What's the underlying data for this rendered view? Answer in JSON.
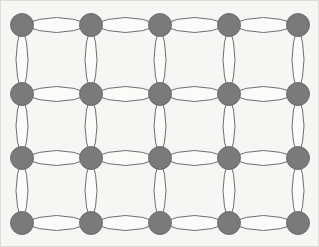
{
  "figure": {
    "type": "graph-diagram",
    "width": 319,
    "height": 247,
    "background_color": "#f6f6f4",
    "border_color": "#dcdcd8"
  },
  "style": {
    "node_fill": "#7a7a7a",
    "node_stroke": "#5f5f5f",
    "node_stroke_width": 0.8,
    "node_radius": 11.5,
    "edge_stroke": "#6e6e6e",
    "edge_stroke_width": 1.0,
    "edge_fill": "#fbfbfa",
    "edge_bulge_horizontal": 7.5,
    "edge_bulge_vertical": 6.0
  },
  "graph": {
    "description": "4 rows by 5 columns lattice of vertices; every adjacent pair joined by a pair of parallel curved edges forming a lens shape",
    "rows": 4,
    "columns": 5,
    "node_count": 20,
    "edge_multiplicity": 2,
    "horizontal_edge_pairs": 15,
    "vertical_edge_pairs": 15,
    "total_edge_pairs": 30,
    "total_edges": 60,
    "column_x": [
      22,
      91,
      160,
      229,
      298
    ],
    "row_y": [
      25,
      94,
      158,
      223
    ],
    "nodes": [
      {
        "id": "n-0-0",
        "row": 0,
        "col": 0,
        "x": 22,
        "y": 25
      },
      {
        "id": "n-0-1",
        "row": 0,
        "col": 1,
        "x": 91,
        "y": 25
      },
      {
        "id": "n-0-2",
        "row": 0,
        "col": 2,
        "x": 160,
        "y": 25
      },
      {
        "id": "n-0-3",
        "row": 0,
        "col": 3,
        "x": 229,
        "y": 25
      },
      {
        "id": "n-0-4",
        "row": 0,
        "col": 4,
        "x": 298,
        "y": 25
      },
      {
        "id": "n-1-0",
        "row": 1,
        "col": 0,
        "x": 22,
        "y": 94
      },
      {
        "id": "n-1-1",
        "row": 1,
        "col": 1,
        "x": 91,
        "y": 94
      },
      {
        "id": "n-1-2",
        "row": 1,
        "col": 2,
        "x": 160,
        "y": 94
      },
      {
        "id": "n-1-3",
        "row": 1,
        "col": 3,
        "x": 229,
        "y": 94
      },
      {
        "id": "n-1-4",
        "row": 1,
        "col": 4,
        "x": 298,
        "y": 94
      },
      {
        "id": "n-2-0",
        "row": 2,
        "col": 0,
        "x": 22,
        "y": 158
      },
      {
        "id": "n-2-1",
        "row": 2,
        "col": 1,
        "x": 91,
        "y": 158
      },
      {
        "id": "n-2-2",
        "row": 2,
        "col": 2,
        "x": 160,
        "y": 158
      },
      {
        "id": "n-2-3",
        "row": 2,
        "col": 3,
        "x": 229,
        "y": 158
      },
      {
        "id": "n-2-4",
        "row": 2,
        "col": 4,
        "x": 298,
        "y": 158
      },
      {
        "id": "n-3-0",
        "row": 3,
        "col": 0,
        "x": 22,
        "y": 223
      },
      {
        "id": "n-3-1",
        "row": 3,
        "col": 1,
        "x": 91,
        "y": 223
      },
      {
        "id": "n-3-2",
        "row": 3,
        "col": 2,
        "x": 160,
        "y": 223
      },
      {
        "id": "n-3-3",
        "row": 3,
        "col": 3,
        "x": 229,
        "y": 223
      },
      {
        "id": "n-3-4",
        "row": 3,
        "col": 4,
        "x": 298,
        "y": 223
      }
    ],
    "edges": [
      {
        "from": "n-0-0",
        "to": "n-0-1",
        "orientation": "horizontal",
        "multiplicity": 2
      },
      {
        "from": "n-0-1",
        "to": "n-0-2",
        "orientation": "horizontal",
        "multiplicity": 2
      },
      {
        "from": "n-0-2",
        "to": "n-0-3",
        "orientation": "horizontal",
        "multiplicity": 2
      },
      {
        "from": "n-0-3",
        "to": "n-0-4",
        "orientation": "horizontal",
        "multiplicity": 2
      },
      {
        "from": "n-1-0",
        "to": "n-1-1",
        "orientation": "horizontal",
        "multiplicity": 2
      },
      {
        "from": "n-1-1",
        "to": "n-1-2",
        "orientation": "horizontal",
        "multiplicity": 2
      },
      {
        "from": "n-1-2",
        "to": "n-1-3",
        "orientation": "horizontal",
        "multiplicity": 2
      },
      {
        "from": "n-1-3",
        "to": "n-1-4",
        "orientation": "horizontal",
        "multiplicity": 2
      },
      {
        "from": "n-2-0",
        "to": "n-2-1",
        "orientation": "horizontal",
        "multiplicity": 2
      },
      {
        "from": "n-2-1",
        "to": "n-2-2",
        "orientation": "horizontal",
        "multiplicity": 2
      },
      {
        "from": "n-2-2",
        "to": "n-2-3",
        "orientation": "horizontal",
        "multiplicity": 2
      },
      {
        "from": "n-2-3",
        "to": "n-2-4",
        "orientation": "horizontal",
        "multiplicity": 2
      },
      {
        "from": "n-3-0",
        "to": "n-3-1",
        "orientation": "horizontal",
        "multiplicity": 2
      },
      {
        "from": "n-3-1",
        "to": "n-3-2",
        "orientation": "horizontal",
        "multiplicity": 2
      },
      {
        "from": "n-3-2",
        "to": "n-3-3",
        "orientation": "horizontal",
        "multiplicity": 2
      },
      {
        "from": "n-3-3",
        "to": "n-3-4",
        "orientation": "horizontal",
        "multiplicity": 2
      },
      {
        "from": "n-0-0",
        "to": "n-1-0",
        "orientation": "vertical",
        "multiplicity": 2
      },
      {
        "from": "n-1-0",
        "to": "n-2-0",
        "orientation": "vertical",
        "multiplicity": 2
      },
      {
        "from": "n-2-0",
        "to": "n-3-0",
        "orientation": "vertical",
        "multiplicity": 2
      },
      {
        "from": "n-0-1",
        "to": "n-1-1",
        "orientation": "vertical",
        "multiplicity": 2
      },
      {
        "from": "n-1-1",
        "to": "n-2-1",
        "orientation": "vertical",
        "multiplicity": 2
      },
      {
        "from": "n-2-1",
        "to": "n-3-1",
        "orientation": "vertical",
        "multiplicity": 2
      },
      {
        "from": "n-0-2",
        "to": "n-1-2",
        "orientation": "vertical",
        "multiplicity": 2
      },
      {
        "from": "n-1-2",
        "to": "n-2-2",
        "orientation": "vertical",
        "multiplicity": 2
      },
      {
        "from": "n-2-2",
        "to": "n-3-2",
        "orientation": "vertical",
        "multiplicity": 2
      },
      {
        "from": "n-0-3",
        "to": "n-1-3",
        "orientation": "vertical",
        "multiplicity": 2
      },
      {
        "from": "n-1-3",
        "to": "n-2-3",
        "orientation": "vertical",
        "multiplicity": 2
      },
      {
        "from": "n-2-3",
        "to": "n-3-3",
        "orientation": "vertical",
        "multiplicity": 2
      },
      {
        "from": "n-0-4",
        "to": "n-1-4",
        "orientation": "vertical",
        "multiplicity": 2
      },
      {
        "from": "n-1-4",
        "to": "n-2-4",
        "orientation": "vertical",
        "multiplicity": 2
      },
      {
        "from": "n-2-4",
        "to": "n-3-4",
        "orientation": "vertical",
        "multiplicity": 2
      }
    ]
  }
}
